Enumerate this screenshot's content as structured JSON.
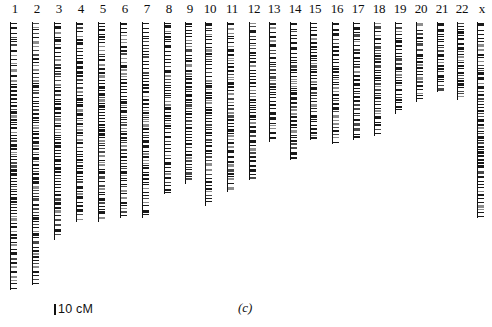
{
  "figure": {
    "panel_label": "(c)",
    "scale": {
      "tick": "scale-tick",
      "text": "10 cM",
      "units": "cM",
      "value": 10
    }
  },
  "chart_data": {
    "type": "bar",
    "title": "",
    "subtitle": "",
    "xlabel": "",
    "ylabel": "",
    "orientation": "vertical-ideogram",
    "grid": false,
    "legend": null,
    "scale_bar_cM": 10,
    "scale_bar_px": 11,
    "axis_note": "Each vertical bar is one chromosome linkage group drawn to a genetic-distance (cM) scale; horizontal ticks are mapped markers.",
    "categories": [
      "1",
      "2",
      "3",
      "4",
      "5",
      "6",
      "7",
      "8",
      "9",
      "10",
      "11",
      "12",
      "13",
      "14",
      "15",
      "16",
      "17",
      "18",
      "19",
      "20",
      "21",
      "22",
      "x"
    ],
    "values": [
      268,
      263,
      218,
      200,
      200,
      196,
      196,
      172,
      162,
      184,
      170,
      158,
      120,
      138,
      118,
      122,
      118,
      114,
      92,
      80,
      70,
      78,
      196
    ],
    "ylim": [
      0,
      270
    ],
    "series": [
      {
        "name": "map length (px at 10 cM = 11 px)",
        "values": [
          268,
          263,
          218,
          200,
          200,
          196,
          196,
          172,
          162,
          184,
          170,
          158,
          120,
          138,
          118,
          122,
          118,
          114,
          92,
          80,
          70,
          78,
          196
        ]
      }
    ]
  },
  "chromosomes": [
    {
      "label": "1",
      "x": 6,
      "top": 22,
      "length": 268
    },
    {
      "label": "2",
      "x": 28,
      "top": 22,
      "length": 263
    },
    {
      "label": "3",
      "x": 50,
      "top": 22,
      "length": 218
    },
    {
      "label": "4",
      "x": 72,
      "top": 22,
      "length": 200
    },
    {
      "label": "5",
      "x": 94,
      "top": 22,
      "length": 200
    },
    {
      "label": "6",
      "x": 116,
      "top": 22,
      "length": 196
    },
    {
      "label": "7",
      "x": 138,
      "top": 22,
      "length": 196
    },
    {
      "label": "8",
      "x": 160,
      "top": 22,
      "length": 172
    },
    {
      "label": "9",
      "x": 181,
      "top": 22,
      "length": 162
    },
    {
      "label": "10",
      "x": 201,
      "top": 22,
      "length": 184
    },
    {
      "label": "11",
      "x": 223,
      "top": 22,
      "length": 170
    },
    {
      "label": "12",
      "x": 245,
      "top": 22,
      "length": 158
    },
    {
      "label": "13",
      "x": 265,
      "top": 22,
      "length": 120
    },
    {
      "label": "14",
      "x": 286,
      "top": 22,
      "length": 138
    },
    {
      "label": "15",
      "x": 306,
      "top": 22,
      "length": 118
    },
    {
      "label": "16",
      "x": 328,
      "top": 22,
      "length": 122
    },
    {
      "label": "17",
      "x": 349,
      "top": 22,
      "length": 118
    },
    {
      "label": "18",
      "x": 370,
      "top": 22,
      "length": 114
    },
    {
      "label": "19",
      "x": 391,
      "top": 22,
      "length": 92
    },
    {
      "label": "20",
      "x": 412,
      "top": 22,
      "length": 80
    },
    {
      "label": "21",
      "x": 433,
      "top": 22,
      "length": 70
    },
    {
      "label": "22",
      "x": 453,
      "top": 22,
      "length": 78
    },
    {
      "label": "x",
      "x": 473,
      "top": 22,
      "length": 196
    }
  ]
}
